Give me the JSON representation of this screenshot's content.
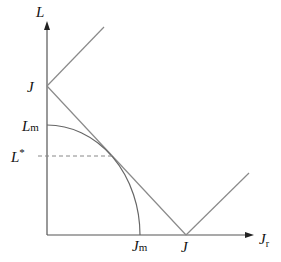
{
  "diagram": {
    "axes": {
      "y_label": "L",
      "x_label": "J",
      "x_label_subscript": "r"
    },
    "labels": {
      "y_intercept": "J",
      "x_intercept": "J",
      "L_m": "L",
      "L_m_subscript": "m",
      "L_star": "L",
      "L_star_superscript": "*",
      "J_m": "J",
      "J_m_subscript": "m"
    },
    "colors": {
      "axis": "#555555",
      "lines": "#8a8a8a",
      "curve": "#666666",
      "dashed": "#888888",
      "text": "#111111"
    }
  }
}
